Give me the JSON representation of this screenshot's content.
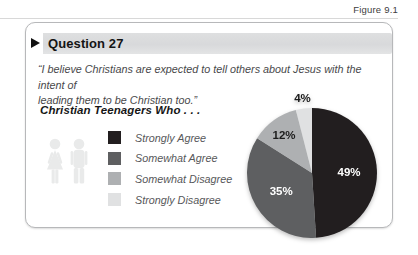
{
  "figure_label": "Figure 9.1",
  "panel": {
    "title": "Question 27",
    "quote_line1": "“I believe Christians are expected to tell others about Jesus with the intent of",
    "quote_line2": "leading them to be Christian too.”",
    "subtitle": "Christian Teenagers Who . . ."
  },
  "chart_data": {
    "type": "pie",
    "title": "Question 27",
    "categories": [
      "Strongly Agree",
      "Somewhat Agree",
      "Somewhat Disagree",
      "Strongly Disagree"
    ],
    "values": [
      49,
      35,
      12,
      4
    ],
    "labels": [
      "49%",
      "35%",
      "12%",
      "4%"
    ],
    "unit": "%",
    "colors": [
      "#221e1f",
      "#5e5f61",
      "#aeb0b2",
      "#e0e1e2"
    ],
    "label_colors": [
      "#ffffff",
      "#ffffff",
      "#1b1b1b",
      "#1b1b1b"
    ],
    "legend_position": "left",
    "start_angle_deg": 0,
    "direction": "clockwise",
    "label_radius": [
      0.57,
      0.55,
      0.73,
      1.17
    ]
  }
}
